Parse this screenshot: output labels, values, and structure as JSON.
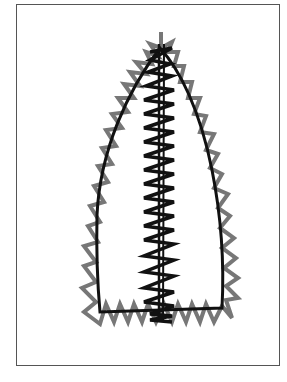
{
  "diagram": {
    "colors": {
      "outline": "#111111",
      "edge_zigzag": "#777777",
      "center_zigzag": "#111111",
      "frame": "#555555",
      "background": "#ffffff"
    },
    "elements": [
      {
        "name": "shape-outline",
        "type": "pointed arch outline with flat base"
      },
      {
        "name": "edge-zigzag",
        "type": "zigzag stitch along outline"
      },
      {
        "name": "center-zigzag",
        "type": "zigzag stitch column down center with straight center line"
      }
    ]
  }
}
